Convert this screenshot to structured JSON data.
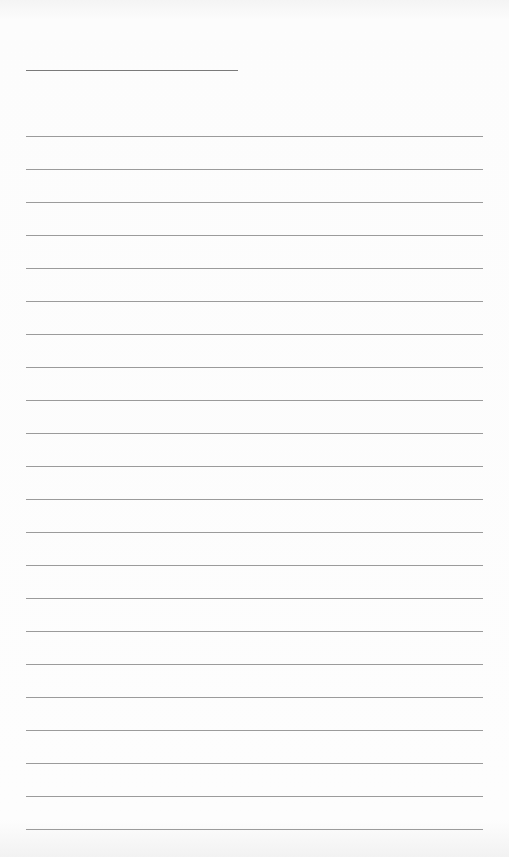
{
  "document": {
    "type": "blank lined paper",
    "title_line": {
      "filled_text": ""
    },
    "ruled_lines": {
      "count": 22,
      "first_y": 136,
      "spacing": 33,
      "color": "#8a8a8a",
      "entries": [
        "",
        "",
        "",
        "",
        "",
        "",
        "",
        "",
        "",
        "",
        "",
        "",
        "",
        "",
        "",
        "",
        "",
        "",
        "",
        "",
        "",
        ""
      ]
    },
    "paper_color": "#fcfcfc"
  }
}
